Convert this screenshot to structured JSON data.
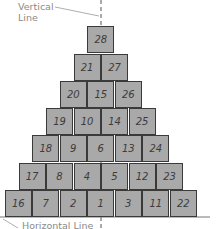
{
  "diagram": {
    "labels": {
      "vertical_line": [
        "Vertical",
        "Line"
      ],
      "horizontal_line": "Horizontal Line"
    },
    "colors": {
      "box_fill": "#a9a9a9",
      "box_border": "#3a3a3a",
      "label_text": "#8a8a8a",
      "guide_line": "#555555"
    },
    "rows": [
      [
        "28"
      ],
      [
        "21",
        "27"
      ],
      [
        "20",
        "15",
        "26"
      ],
      [
        "19",
        "10",
        "14",
        "25"
      ],
      [
        "18",
        "9",
        "6",
        "13",
        "24"
      ],
      [
        "17",
        "8",
        "4",
        "5",
        "12",
        "23"
      ],
      [
        "16",
        "7",
        "2",
        "1",
        "3",
        "11",
        "22"
      ]
    ]
  }
}
